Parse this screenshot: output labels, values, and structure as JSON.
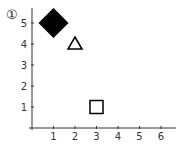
{
  "label": "①",
  "chart_data": {
    "type": "scatter",
    "title": "",
    "xlabel": "",
    "ylabel": "",
    "x_ticks": [
      1,
      2,
      3,
      4,
      5,
      6
    ],
    "y_ticks": [
      1,
      2,
      3,
      4,
      5
    ],
    "xlim": [
      0,
      6.5
    ],
    "ylim": [
      0,
      5.5
    ],
    "grid": false,
    "points": [
      {
        "x": 1,
        "y": 5,
        "marker": "diamond",
        "filled": true,
        "color": "#000000"
      },
      {
        "x": 2,
        "y": 4,
        "marker": "triangle",
        "filled": false,
        "color": "#000000"
      },
      {
        "x": 3,
        "y": 1,
        "marker": "square",
        "filled": false,
        "color": "#000000"
      }
    ]
  }
}
